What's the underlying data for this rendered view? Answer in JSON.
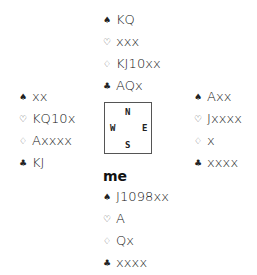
{
  "suit_symbols": {
    "spades": "♠",
    "hearts": "♡",
    "diamonds": "♢",
    "clubs": "♣"
  },
  "compass": {
    "north": "N",
    "south": "S",
    "west": "W",
    "east": "E"
  },
  "hands": {
    "north": {
      "spades": "KQ",
      "hearts": "xxx",
      "diamonds": "KJ10xx",
      "clubs": "AQx"
    },
    "west": {
      "spades": "xx",
      "hearts": "KQ10x",
      "diamonds": "Axxxx",
      "clubs": "KJ"
    },
    "east": {
      "spades": "Axx",
      "hearts": "Jxxxx",
      "diamonds": "x",
      "clubs": "xxxx"
    },
    "south": {
      "label": "me",
      "spades": "J1098xx",
      "hearts": "A",
      "diamonds": "Qx",
      "clubs": "xxxx"
    }
  }
}
